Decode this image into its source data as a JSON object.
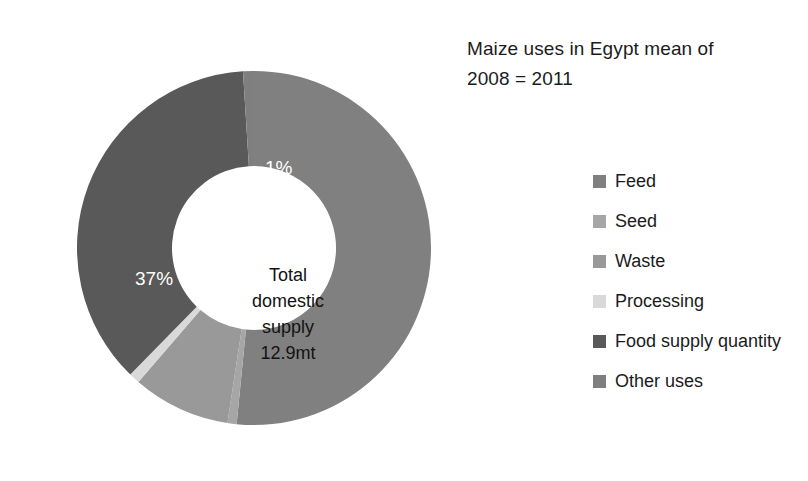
{
  "chart_data": {
    "type": "pie",
    "variant": "donut",
    "title": "Maize uses in Egypt mean of\n2008 = 2011",
    "center_label": "Total\ndomestic\nsupply\n12.9mt",
    "categories": [
      "Feed",
      "Seed",
      "Waste",
      "Processing",
      "Food supply quantity",
      "Other uses"
    ],
    "values": [
      52,
      0,
      9,
      1,
      37,
      1
    ],
    "data_labels": [
      "52%",
      "0%",
      "9%",
      "1%",
      "37%",
      "1%"
    ],
    "colors": [
      "#808080",
      "#a6a6a6",
      "#999999",
      "#d9d9d9",
      "#595959",
      "#7f7f7f"
    ],
    "units": "percent of total domestic supply",
    "total": "12.9mt",
    "legend_position": "right",
    "grid": false,
    "xlabel": "",
    "ylabel": "",
    "slices": [
      {
        "name": "Feed",
        "value": 52,
        "label": "52%",
        "color": "#808080"
      },
      {
        "name": "Seed",
        "value": 0,
        "label": "0%",
        "color": "#a6a6a6"
      },
      {
        "name": "Waste",
        "value": 9,
        "label": "9%",
        "color": "#999999"
      },
      {
        "name": "Processing",
        "value": 1,
        "label": "1%",
        "color": "#d9d9d9"
      },
      {
        "name": "Food supply quantity",
        "value": 37,
        "label": "37%",
        "color": "#595959"
      },
      {
        "name": "Other uses",
        "value": 1,
        "label": "1%",
        "color": "#7f7f7f"
      }
    ]
  },
  "legend": {
    "items": [
      {
        "label": "Feed",
        "color": "#808080"
      },
      {
        "label": "Seed",
        "color": "#a6a6a6"
      },
      {
        "label": "Waste",
        "color": "#999999"
      },
      {
        "label": "Processing",
        "color": "#d9d9d9"
      },
      {
        "label": "Food supply quantity",
        "color": "#595959"
      },
      {
        "label": "Other uses",
        "color": "#7f7f7f"
      }
    ]
  }
}
